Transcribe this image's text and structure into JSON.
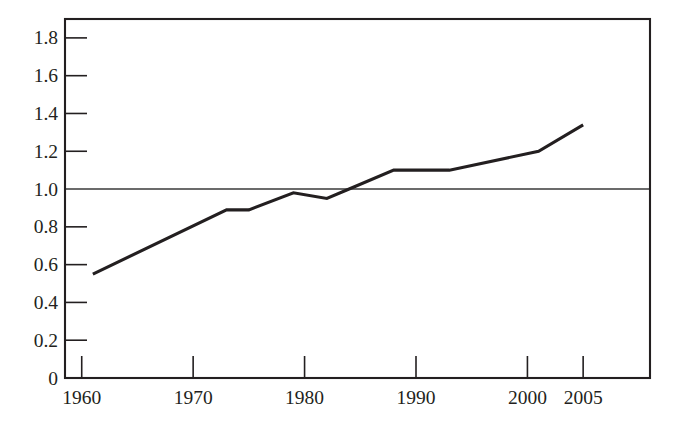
{
  "chart_data": {
    "type": "line",
    "title": "",
    "subtitle": "",
    "xlabel": "",
    "ylabel": "",
    "xlim": [
      1958.5,
      2011.0
    ],
    "ylim": [
      0,
      1.9
    ],
    "grid": false,
    "legend": null,
    "x_ticks": [
      1960,
      1970,
      1980,
      1990,
      2000,
      2005
    ],
    "x_tick_labels": [
      "1960",
      "1970",
      "1980",
      "1990",
      "2000",
      "2005"
    ],
    "y_ticks": [
      0,
      0.2,
      0.4,
      0.6,
      0.8,
      1.0,
      1.2,
      1.4,
      1.6,
      1.8
    ],
    "y_tick_labels": [
      "0",
      "0.2",
      "0.4",
      "0.6",
      "0.8",
      "1.0",
      "1.2",
      "1.4",
      "1.6",
      "1.8"
    ],
    "annotations": [
      {
        "name": "reference-line",
        "type": "hline",
        "value": 1.0,
        "label": ""
      }
    ],
    "series": [
      {
        "name": "series-1",
        "color": "#231f20",
        "x": [
          1961,
          1973,
          1975,
          1979,
          1982,
          1984,
          1988,
          1993,
          2001,
          2005
        ],
        "values": [
          0.55,
          0.89,
          0.89,
          0.98,
          0.95,
          1.0,
          1.1,
          1.1,
          1.2,
          1.34
        ]
      }
    ]
  },
  "colors": {
    "axis": "#231f20",
    "line": "#231f20",
    "reference": "#3a3a3a",
    "background": "#ffffff"
  }
}
